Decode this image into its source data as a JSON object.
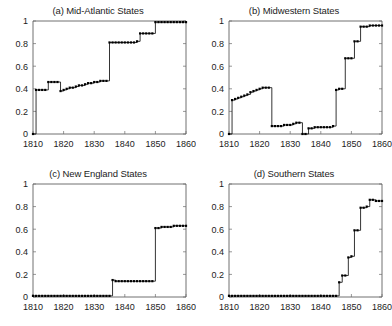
{
  "figure": {
    "background_color": "#ffffff",
    "line_color": "#111111",
    "marker_color": "#000000",
    "axis_color": "#4d4d4d"
  },
  "panels": [
    {
      "id": "a",
      "title": "(a) Mid-Atlantic States"
    },
    {
      "id": "b",
      "title": "(b) Midwestern States"
    },
    {
      "id": "c",
      "title": "(c) New England States"
    },
    {
      "id": "d",
      "title": "(d) Southern States"
    }
  ],
  "chart_data": [
    {
      "type": "line",
      "title": "(a) Mid-Atlantic States",
      "xlabel": "",
      "ylabel": "",
      "xlim": [
        1810,
        1860
      ],
      "ylim": [
        0,
        1
      ],
      "xticks": [
        1810,
        1820,
        1830,
        1840,
        1850,
        1860
      ],
      "yticks": [
        0,
        0.2,
        0.4,
        0.6,
        0.8,
        1
      ],
      "grid": false,
      "legend": "none",
      "x": [
        1810,
        1811,
        1812,
        1813,
        1814,
        1815,
        1816,
        1817,
        1818,
        1819,
        1820,
        1821,
        1822,
        1823,
        1824,
        1825,
        1826,
        1827,
        1828,
        1829,
        1830,
        1831,
        1832,
        1833,
        1834,
        1835,
        1836,
        1837,
        1838,
        1839,
        1840,
        1841,
        1842,
        1843,
        1844,
        1845,
        1846,
        1847,
        1848,
        1849,
        1850,
        1851,
        1852,
        1853,
        1854,
        1855,
        1856,
        1857,
        1858,
        1859,
        1860
      ],
      "y": [
        0.0,
        0.39,
        0.39,
        0.39,
        0.39,
        0.46,
        0.46,
        0.46,
        0.46,
        0.38,
        0.39,
        0.4,
        0.41,
        0.41,
        0.42,
        0.43,
        0.43,
        0.44,
        0.45,
        0.45,
        0.46,
        0.46,
        0.47,
        0.47,
        0.47,
        0.81,
        0.81,
        0.81,
        0.81,
        0.81,
        0.81,
        0.81,
        0.81,
        0.81,
        0.82,
        0.89,
        0.89,
        0.89,
        0.89,
        0.89,
        0.99,
        0.99,
        0.99,
        0.99,
        0.99,
        0.99,
        0.99,
        0.99,
        0.99,
        0.99,
        0.99
      ]
    },
    {
      "type": "line",
      "title": "(b) Midwestern States",
      "xlabel": "",
      "ylabel": "",
      "xlim": [
        1810,
        1860
      ],
      "ylim": [
        0,
        1
      ],
      "xticks": [
        1810,
        1820,
        1830,
        1840,
        1850,
        1860
      ],
      "yticks": [
        0,
        0.2,
        0.4,
        0.6,
        0.8,
        1
      ],
      "grid": false,
      "legend": "none",
      "x": [
        1810,
        1811,
        1812,
        1813,
        1814,
        1815,
        1816,
        1817,
        1818,
        1819,
        1820,
        1821,
        1822,
        1823,
        1824,
        1825,
        1826,
        1827,
        1828,
        1829,
        1830,
        1831,
        1832,
        1833,
        1834,
        1835,
        1836,
        1837,
        1838,
        1839,
        1840,
        1841,
        1842,
        1843,
        1844,
        1845,
        1846,
        1847,
        1848,
        1849,
        1850,
        1851,
        1852,
        1853,
        1854,
        1855,
        1856,
        1857,
        1858,
        1859,
        1860
      ],
      "y": [
        0.0,
        0.3,
        0.31,
        0.32,
        0.33,
        0.34,
        0.35,
        0.37,
        0.38,
        0.39,
        0.4,
        0.41,
        0.41,
        0.41,
        0.07,
        0.07,
        0.07,
        0.07,
        0.08,
        0.08,
        0.08,
        0.09,
        0.1,
        0.1,
        0.0,
        0.0,
        0.05,
        0.05,
        0.06,
        0.06,
        0.06,
        0.06,
        0.06,
        0.06,
        0.07,
        0.39,
        0.4,
        0.4,
        0.67,
        0.67,
        0.67,
        0.82,
        0.82,
        0.95,
        0.95,
        0.95,
        0.96,
        0.96,
        0.96,
        0.96,
        0.96
      ]
    },
    {
      "type": "line",
      "title": "(c) New England States",
      "xlabel": "",
      "ylabel": "",
      "xlim": [
        1810,
        1860
      ],
      "ylim": [
        0,
        1
      ],
      "xticks": [
        1810,
        1820,
        1830,
        1840,
        1850,
        1860
      ],
      "yticks": [
        0,
        0.2,
        0.4,
        0.6,
        0.8,
        1
      ],
      "grid": false,
      "legend": "none",
      "x": [
        1810,
        1811,
        1812,
        1813,
        1814,
        1815,
        1816,
        1817,
        1818,
        1819,
        1820,
        1821,
        1822,
        1823,
        1824,
        1825,
        1826,
        1827,
        1828,
        1829,
        1830,
        1831,
        1832,
        1833,
        1834,
        1835,
        1836,
        1837,
        1838,
        1839,
        1840,
        1841,
        1842,
        1843,
        1844,
        1845,
        1846,
        1847,
        1848,
        1849,
        1850,
        1851,
        1852,
        1853,
        1854,
        1855,
        1856,
        1857,
        1858,
        1859,
        1860
      ],
      "y": [
        0.01,
        0.01,
        0.01,
        0.01,
        0.01,
        0.01,
        0.01,
        0.01,
        0.01,
        0.01,
        0.01,
        0.01,
        0.01,
        0.01,
        0.01,
        0.01,
        0.01,
        0.01,
        0.01,
        0.01,
        0.01,
        0.01,
        0.01,
        0.01,
        0.01,
        0.01,
        0.15,
        0.14,
        0.14,
        0.14,
        0.14,
        0.14,
        0.14,
        0.14,
        0.14,
        0.14,
        0.14,
        0.14,
        0.14,
        0.14,
        0.61,
        0.61,
        0.62,
        0.62,
        0.62,
        0.62,
        0.63,
        0.63,
        0.63,
        0.63,
        0.63
      ]
    },
    {
      "type": "line",
      "title": "(d) Southern States",
      "xlabel": "",
      "ylabel": "",
      "xlim": [
        1810,
        1860
      ],
      "ylim": [
        0,
        1
      ],
      "xticks": [
        1810,
        1820,
        1830,
        1840,
        1850,
        1860
      ],
      "yticks": [
        0,
        0.2,
        0.4,
        0.6,
        0.8,
        1
      ],
      "grid": false,
      "legend": "none",
      "x": [
        1810,
        1811,
        1812,
        1813,
        1814,
        1815,
        1816,
        1817,
        1818,
        1819,
        1820,
        1821,
        1822,
        1823,
        1824,
        1825,
        1826,
        1827,
        1828,
        1829,
        1830,
        1831,
        1832,
        1833,
        1834,
        1835,
        1836,
        1837,
        1838,
        1839,
        1840,
        1841,
        1842,
        1843,
        1844,
        1845,
        1846,
        1847,
        1848,
        1849,
        1850,
        1851,
        1852,
        1853,
        1854,
        1855,
        1856,
        1857,
        1858,
        1859,
        1860
      ],
      "y": [
        0.01,
        0.01,
        0.01,
        0.01,
        0.01,
        0.01,
        0.01,
        0.01,
        0.01,
        0.01,
        0.01,
        0.01,
        0.01,
        0.01,
        0.01,
        0.01,
        0.01,
        0.01,
        0.01,
        0.01,
        0.01,
        0.01,
        0.01,
        0.01,
        0.01,
        0.01,
        0.01,
        0.01,
        0.01,
        0.01,
        0.01,
        0.01,
        0.01,
        0.01,
        0.01,
        0.01,
        0.13,
        0.19,
        0.19,
        0.35,
        0.36,
        0.59,
        0.59,
        0.79,
        0.79,
        0.8,
        0.86,
        0.86,
        0.85,
        0.85,
        0.85
      ]
    }
  ]
}
